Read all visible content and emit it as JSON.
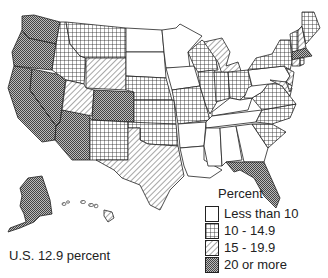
{
  "legend": {
    "title": "Percent",
    "items": [
      {
        "label": "Less than 10",
        "pattern": "none"
      },
      {
        "label": "10 - 14.9",
        "pattern": "grid"
      },
      {
        "label": "15 - 19.9",
        "pattern": "diagonal"
      },
      {
        "label": "20 or more",
        "pattern": "dots"
      }
    ]
  },
  "summary": "U.S. 12.9 percent",
  "states": {
    "20_or_more": [
      "WA",
      "OR",
      "CA",
      "NV",
      "CO",
      "AZ",
      "FL",
      "AK"
    ],
    "15_to_19.9": [
      "UT",
      "WY",
      "NM",
      "TX",
      "MI",
      "HI",
      "NH",
      "MA",
      "RI",
      "CT",
      "NJ",
      "MD"
    ],
    "10_to_14.9": [
      "MT",
      "ID",
      "NE",
      "KS",
      "OK",
      "MO",
      "IL",
      "IN",
      "WI",
      "OH",
      "VT",
      "ME",
      "NY",
      "VA",
      "NC",
      "SC",
      "DE"
    ],
    "less_than_10": [
      "ND",
      "SD",
      "MN",
      "IA",
      "AR",
      "LA",
      "MS",
      "AL",
      "GA",
      "TN",
      "KY",
      "WV",
      "PA"
    ]
  }
}
